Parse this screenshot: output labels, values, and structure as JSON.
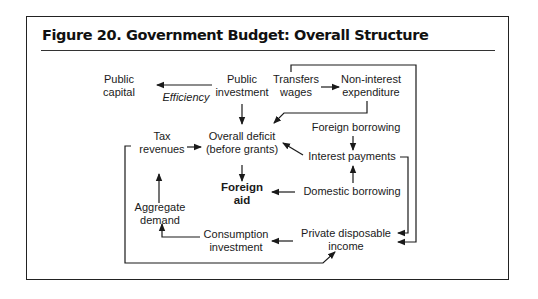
{
  "figure": {
    "title": "Figure 20.  Government Budget: Overall Structure"
  },
  "nodes": {
    "public_capital": {
      "line1": "Public",
      "line2": "capital"
    },
    "efficiency": {
      "label": "Efficiency"
    },
    "public_investment": {
      "line1": "Public",
      "line2": "investment"
    },
    "transfers_wages": {
      "line1": "Transfers",
      "line2": "wages"
    },
    "non_interest_expenditure": {
      "line1": "Non-interest",
      "line2": "expenditure"
    },
    "tax_revenues": {
      "line1": "Tax",
      "line2": "revenues"
    },
    "overall_deficit": {
      "line1": "Overall deficit",
      "line2": "(before grants)"
    },
    "foreign_borrowing": {
      "label": "Foreign borrowing"
    },
    "interest_payments": {
      "label": "Interest payments"
    },
    "foreign_aid": {
      "line1": "Foreign",
      "line2": "aid"
    },
    "domestic_borrowing": {
      "label": "Domestic borrowing"
    },
    "aggregate_demand": {
      "line1": "Aggregate",
      "line2": "demand"
    },
    "consumption_investment": {
      "line1": "Consumption",
      "line2": "investment"
    },
    "private_disposable_income": {
      "line1": "Private disposable",
      "line2": "income"
    }
  },
  "edges": [
    {
      "from": "Public investment",
      "to": "Public capital",
      "label": "Efficiency"
    },
    {
      "from": "Public investment",
      "to": "Overall deficit (before grants)"
    },
    {
      "from": "Transfers wages",
      "to": "Non-interest expenditure"
    },
    {
      "from": "Transfers wages",
      "to": "Private disposable income"
    },
    {
      "from": "Non-interest expenditure",
      "to": "Overall deficit (before grants)"
    },
    {
      "from": "Tax revenues",
      "to": "Overall deficit (before grants)"
    },
    {
      "from": "Foreign borrowing",
      "to": "Interest payments"
    },
    {
      "from": "Domestic borrowing",
      "to": "Interest payments"
    },
    {
      "from": "Interest payments",
      "to": "Overall deficit (before grants)"
    },
    {
      "from": "Interest payments",
      "to": "Private disposable income"
    },
    {
      "from": "Overall deficit (before grants)",
      "to": "Foreign aid"
    },
    {
      "from": "Domestic borrowing",
      "to": "Foreign aid"
    },
    {
      "from": "Private disposable income",
      "to": "Consumption investment"
    },
    {
      "from": "Consumption investment",
      "to": "Aggregate demand"
    },
    {
      "from": "Aggregate demand",
      "to": "Tax revenues"
    },
    {
      "from": "Tax revenues",
      "to": "Private disposable income"
    }
  ],
  "colors": {
    "ink": "#1a1a1a",
    "background": "#ffffff"
  }
}
